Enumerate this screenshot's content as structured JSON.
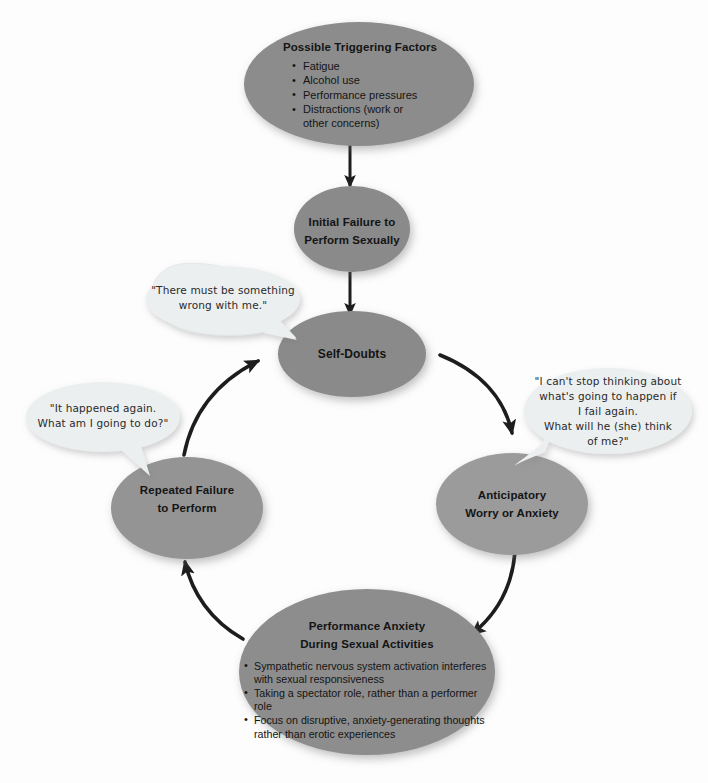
{
  "diagram": {
    "colors": {
      "background": "#fdfdfd",
      "ellipse_dark": "#8a8a8a",
      "ellipse_mid": "#949494",
      "ellipse_light": "#9d9d9d",
      "bubble_fill": "#eceff0",
      "bubble_stroke": "#e2e6e7",
      "arrow": "#1d1d1d",
      "text": "#141414",
      "shadow": "rgba(90,90,90,0.30)"
    },
    "nodes": {
      "triggering_factors": {
        "title": "Possible Triggering Factors",
        "bullets": [
          "Fatigue",
          "Alcohol use",
          "Performance pressures",
          "Distractions (work or other concerns)"
        ]
      },
      "initial_failure": {
        "line1": "Initial Failure to",
        "line2": "Perform Sexually"
      },
      "self_doubts": {
        "line1": "Self-Doubts"
      },
      "anticipatory_worry": {
        "line1": "Anticipatory",
        "line2": "Worry or Anxiety"
      },
      "performance_anxiety": {
        "line1": "Performance Anxiety",
        "line2": "During Sexual Activities",
        "bullets": [
          "Sympathetic nervous system activation interferes with sexual responsiveness",
          "Taking a spectator role, rather than a performer role",
          "Focus on disruptive, anxiety-generating thoughts rather than erotic experiences"
        ]
      },
      "repeated_failure": {
        "line1": "Repeated Failure",
        "line2": "to Perform"
      }
    },
    "bubbles": {
      "self_doubt_thought": {
        "lines": [
          "\"There must be something",
          "wrong with me.\""
        ]
      },
      "anticipatory_thought": {
        "lines": [
          "\"I can't stop thinking about",
          "what's going to happen if",
          "I fail again.",
          "What will he (she) think",
          "of me?\""
        ]
      },
      "repeated_failure_thought": {
        "lines": [
          "\"It happened again.",
          "What am I going to do?\""
        ]
      }
    },
    "arrows": [
      {
        "name": "triggering-to-initial-failure",
        "from": "triggering_factors",
        "to": "initial_failure",
        "style": "straight-vertical"
      },
      {
        "name": "initial-failure-to-self-doubts",
        "from": "initial_failure",
        "to": "self_doubts",
        "style": "straight-vertical"
      },
      {
        "name": "self-doubts-to-anticipatory",
        "from": "self_doubts",
        "to": "anticipatory_worry",
        "style": "curved-clockwise"
      },
      {
        "name": "anticipatory-to-performance-anxiety",
        "from": "anticipatory_worry",
        "to": "performance_anxiety",
        "style": "curved-clockwise"
      },
      {
        "name": "performance-anxiety-to-repeated-failure",
        "from": "performance_anxiety",
        "to": "repeated_failure",
        "style": "curved-clockwise"
      },
      {
        "name": "repeated-failure-to-self-doubts",
        "from": "repeated_failure",
        "to": "self_doubts",
        "style": "curved-clockwise"
      }
    ]
  }
}
